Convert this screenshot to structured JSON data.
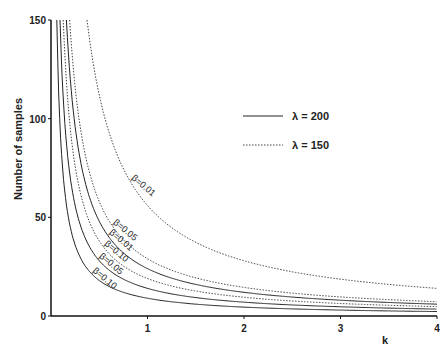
{
  "chart_data": {
    "type": "line",
    "title": "",
    "xlabel": "k",
    "ylabel": "Number of samples",
    "xlim": [
      0,
      4
    ],
    "ylim": [
      0,
      150
    ],
    "xticks": [
      "1",
      "2",
      "3",
      "4"
    ],
    "yticks": [
      "0",
      "50",
      "100",
      "150"
    ],
    "grid": false,
    "legend": {
      "position": "upper right",
      "entries": [
        {
          "label": "λ = 200",
          "style": "solid"
        },
        {
          "label": "λ = 150",
          "style": "dotted"
        }
      ]
    },
    "series": [
      {
        "name": "λ=150, β=0.01",
        "style": "dotted",
        "label": "β=0.01",
        "C": 56
      },
      {
        "name": "λ=150, β=0.05",
        "style": "dotted",
        "label": "β=0.05",
        "C": 29
      },
      {
        "name": "λ=200, β=0.01",
        "style": "solid",
        "label": "β=0.01",
        "C": 24
      },
      {
        "name": "λ=150, β=0.10",
        "style": "dotted",
        "label": "β=0.10",
        "C": 19
      },
      {
        "name": "λ=200, β=0.05",
        "style": "solid",
        "label": "β=0.05",
        "C": 14
      },
      {
        "name": "λ=200, β=0.10",
        "style": "solid",
        "label": "β=0.10",
        "C": 9
      }
    ],
    "note": "Curves approximately y = C / k"
  }
}
